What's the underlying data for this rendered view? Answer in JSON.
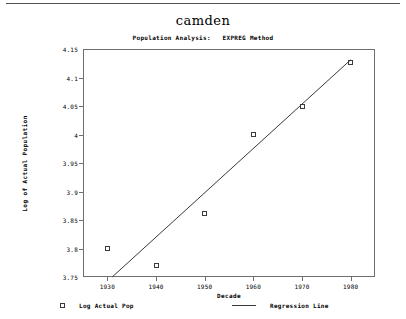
{
  "chart_data": {
    "type": "scatter",
    "title": "camden",
    "subtitle": "Population Analysis:   EXPREG Method",
    "xlabel": "Decade",
    "ylabel": "Log of Actual Population",
    "grid": false,
    "legend_position": "bottom",
    "xlim": [
      1925,
      1985
    ],
    "ylim": [
      3.75,
      4.15
    ],
    "x": [
      1930,
      1940,
      1950,
      1960,
      1970,
      1980
    ],
    "xticklabels": [
      "1930",
      "1940",
      "1950",
      "1960",
      "1970",
      "1980"
    ],
    "yticks": [
      3.75,
      3.8,
      3.85,
      3.9,
      3.95,
      4.0,
      4.05,
      4.1,
      4.15
    ],
    "yticklabels": [
      "3.75",
      "3.8",
      "3.85",
      "3.9",
      "3.95",
      "4",
      "4.05",
      "4.1",
      "4.15"
    ],
    "series": [
      {
        "name": "Log Actual Pop",
        "marker": "open-square",
        "values": [
          3.8,
          3.77,
          3.862,
          4.0,
          4.05,
          4.127
        ]
      },
      {
        "name": "Regression Line",
        "marker": "line",
        "x": [
          1931,
          1980
        ],
        "values": [
          3.75,
          4.131
        ]
      }
    ],
    "legend": [
      {
        "label": "Log Actual Pop",
        "swatch": "open-square"
      },
      {
        "label": "Regression Line",
        "swatch": "line"
      }
    ]
  }
}
